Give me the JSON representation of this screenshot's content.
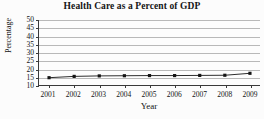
{
  "chart_data": {
    "type": "line",
    "title": "Health Care as a Percent of GDP",
    "xlabel": "Year",
    "ylabel": "Percentage",
    "categories": [
      "2001",
      "2002",
      "2003",
      "2004",
      "2005",
      "2006",
      "2007",
      "2008",
      "2009"
    ],
    "x": [
      2001,
      2002,
      2003,
      2004,
      2005,
      2006,
      2007,
      2008,
      2009
    ],
    "values": [
      14.5,
      15.3,
      15.6,
      15.7,
      15.8,
      15.8,
      15.9,
      16.0,
      17.2
    ],
    "series": [
      {
        "name": "Health Care Percent of GDP",
        "values": [
          14.5,
          15.3,
          15.6,
          15.7,
          15.8,
          15.8,
          15.9,
          16.0,
          17.2
        ]
      }
    ],
    "ylim": [
      10,
      50
    ],
    "yticks": [
      10,
      15,
      20,
      25,
      30,
      35,
      40,
      45,
      50
    ],
    "ytick_labels": [
      "10",
      "15",
      "20",
      "25",
      "30",
      "35",
      "40",
      "45",
      "50"
    ],
    "xlim": [
      2000.6,
      2009.4
    ],
    "grid": "horizontal",
    "legend": "none",
    "marker": "square",
    "line_color": "#2b2b2b",
    "marker_color": "#141414",
    "grid_color": "#b9b9b9",
    "axis_color": "#3a3a3a",
    "background_color": "#fdfdfd"
  }
}
